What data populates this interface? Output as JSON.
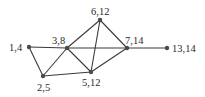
{
  "graph": {
    "nodes": [
      {
        "id": "n14",
        "label": "1,4"
      },
      {
        "id": "n38",
        "label": "3,8"
      },
      {
        "id": "n612",
        "label": "6,12"
      },
      {
        "id": "n714",
        "label": "7,14"
      },
      {
        "id": "n1314",
        "label": "13,14"
      },
      {
        "id": "n25",
        "label": "2,5"
      },
      {
        "id": "n512",
        "label": "5,12"
      }
    ],
    "edges": [
      [
        "n14",
        "n38"
      ],
      [
        "n38",
        "n714"
      ],
      [
        "n714",
        "n1314"
      ],
      [
        "n14",
        "n25"
      ],
      [
        "n25",
        "n38"
      ],
      [
        "n25",
        "n512"
      ],
      [
        "n38",
        "n612"
      ],
      [
        "n38",
        "n512"
      ],
      [
        "n612",
        "n512"
      ],
      [
        "n612",
        "n714"
      ],
      [
        "n512",
        "n714"
      ]
    ],
    "colors": {
      "edge": "#3a3a3a",
      "node": "#4a4a4a",
      "text": "#2a2a2a"
    }
  }
}
